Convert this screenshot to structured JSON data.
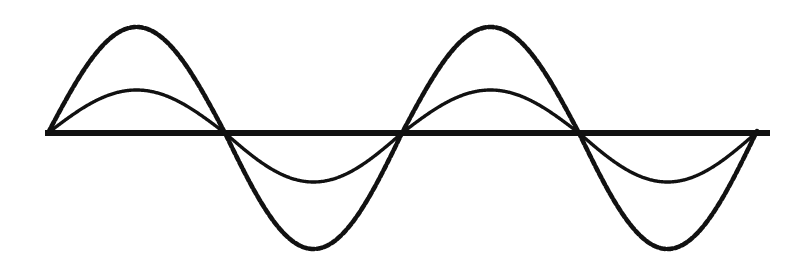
{
  "figure": {
    "kind": "waveform-diagram",
    "title": "",
    "background_color": "#ffffff",
    "width": 802,
    "height": 275
  },
  "chart_data": {
    "type": "line",
    "title": "",
    "subtitle": "",
    "xlabel": "",
    "ylabel": "",
    "grid": false,
    "legend_position": "none",
    "axis": {
      "name": "horizontal-zero-axis",
      "y_value": 0,
      "y_pixel": 133,
      "x_start_pixel": 45,
      "x_end_pixel": 770,
      "color": "#111111",
      "thickness_px": 6,
      "style": "solid"
    },
    "x": [
      0,
      0.125,
      0.25,
      0.375,
      0.5,
      0.625,
      0.75,
      0.875,
      1,
      1.125,
      1.25,
      1.375,
      1.5,
      1.625,
      1.75,
      1.875,
      2
    ],
    "x_unit": "cycles",
    "x_range_cycles": [
      0,
      2
    ],
    "cycles_shown": 2,
    "period_pixels": 354,
    "series": [
      {
        "name": "small-amplitude sine",
        "style": "solid",
        "color": "#111111",
        "thickness_px": 3.4,
        "amplitude": 0.4,
        "amplitude_px_up": 43,
        "amplitude_px_down": 49,
        "phase_deg": 0,
        "values": [
          0,
          0.283,
          0.4,
          0.283,
          0,
          -0.283,
          -0.4,
          -0.283,
          0,
          0.283,
          0.4,
          0.283,
          0,
          -0.283,
          -0.4,
          -0.283,
          0
        ],
        "peak_x_pixels": [
          138,
          492
        ],
        "trough_x_pixels": [
          315,
          669
        ],
        "peak_y_pixel": 91,
        "trough_y_pixel": 182
      },
      {
        "name": "large-amplitude sine",
        "style": "dashed",
        "color": "#111111",
        "thickness_px": 4.6,
        "dash_pattern_px": "5 2.6",
        "amplitude": 1.0,
        "amplitude_px_up": 106,
        "amplitude_px_down": 116,
        "phase_deg": 0,
        "values": [
          0,
          0.707,
          1,
          0.707,
          0,
          -0.707,
          -1,
          -0.707,
          0,
          0.707,
          1,
          0.707,
          0,
          -0.707,
          -1,
          -0.707,
          0
        ],
        "peak_x_pixels": [
          138,
          492
        ],
        "trough_x_pixels": [
          315,
          669
        ],
        "peak_y_pixel": 27,
        "trough_y_pixel": 249
      }
    ],
    "zero_crossings_x_pixels": [
      48,
      225,
      403,
      580,
      757
    ],
    "ylim": [
      -1.15,
      1.15
    ],
    "annotations": []
  }
}
